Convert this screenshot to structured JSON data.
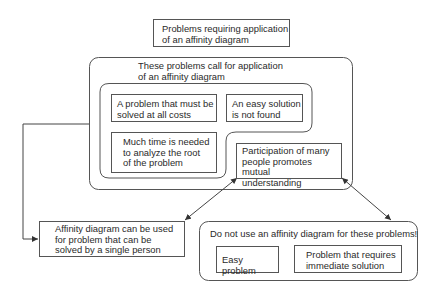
{
  "diagram": {
    "title_box": {
      "lines": [
        "Problems requiring application",
        "of an affinity diagram"
      ]
    },
    "call_for_group": {
      "heading": [
        "These problems call for application",
        "of an affinity diagram"
      ],
      "items": [
        {
          "lines": [
            "A problem that must be",
            "solved at all costs"
          ]
        },
        {
          "lines": [
            "An easy solution",
            "is not found"
          ]
        },
        {
          "lines": [
            "Much time is needed",
            "to analyze the root",
            "of the problem"
          ]
        },
        {
          "lines": [
            "Participation of many",
            "people promotes mutual",
            "understanding"
          ]
        }
      ]
    },
    "single_person_box": {
      "lines": [
        "Affinity diagram can be used",
        "for problem that can be",
        "solved by a single person"
      ]
    },
    "do_not_use_group": {
      "heading": "Do not use an affinity diagram for these problems!",
      "items": [
        {
          "lines": [
            "Easy problem"
          ]
        },
        {
          "lines": [
            "Problem that requires",
            "immediate solution"
          ]
        }
      ]
    },
    "colors": {
      "line": "#444444",
      "text": "#2a2a2a",
      "background": "#ffffff"
    }
  }
}
